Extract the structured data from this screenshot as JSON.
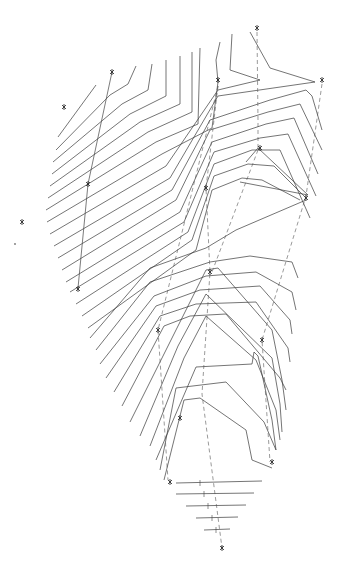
{
  "map": {
    "type": "topographic-contour-plan",
    "line_color": "#3a3a3a",
    "background": "#ffffff",
    "survey_points": [
      {
        "id": "p1",
        "label": ""
      },
      {
        "id": "p2",
        "label": ""
      },
      {
        "id": "p3",
        "label": ""
      },
      {
        "id": "p4",
        "label": ""
      },
      {
        "id": "p5",
        "label": ""
      },
      {
        "id": "p6",
        "label": ""
      },
      {
        "id": "p7",
        "label": ""
      },
      {
        "id": "p8",
        "label": ""
      },
      {
        "id": "p9",
        "label": ""
      },
      {
        "id": "p10",
        "label": ""
      },
      {
        "id": "p11",
        "label": ""
      },
      {
        "id": "p12",
        "label": ""
      },
      {
        "id": "p13",
        "label": ""
      },
      {
        "id": "p14",
        "label": ""
      },
      {
        "id": "p15",
        "label": ""
      },
      {
        "id": "p16",
        "label": ""
      },
      {
        "id": "p17",
        "label": ""
      }
    ],
    "note": "Survey point elevation labels are illegible at this resolution"
  }
}
